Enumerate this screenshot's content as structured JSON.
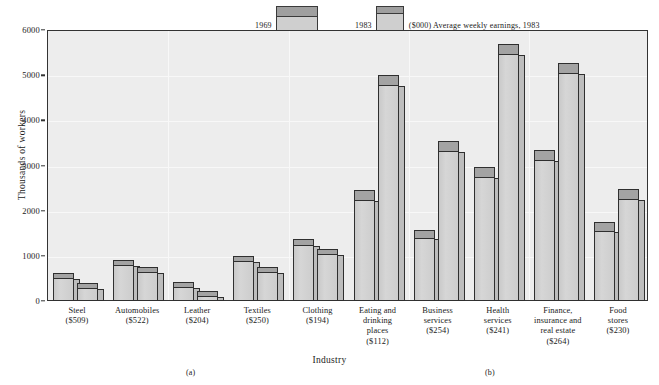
{
  "chart_data": {
    "type": "bar",
    "title": "",
    "xlabel": "Industry",
    "ylabel": "Thousands of workers",
    "ylim": [
      0,
      6000
    ],
    "yticks": [
      0,
      1000,
      2000,
      3000,
      4000,
      5000,
      6000
    ],
    "grid": true,
    "legend_position": "top",
    "legend_note": "($000) Average weekly earnings, 1983",
    "series": [
      {
        "name": "1969",
        "values": [
          620,
          900,
          410,
          1000,
          1380,
          2450,
          1570,
          2960,
          3340,
          1740
        ]
      },
      {
        "name": "1983",
        "values": [
          400,
          760,
          230,
          750,
          1150,
          5000,
          3540,
          5690,
          5270,
          2480
        ]
      }
    ],
    "categories": [
      "Steel",
      "Automobiles",
      "Leather",
      "Textiles",
      "Clothing",
      "Eating and drinking places",
      "Business services",
      "Health services",
      "Finance, insurance and real estate",
      "Food stores"
    ],
    "category_lines": [
      [
        "Steel",
        "($509)"
      ],
      [
        "Automobiles",
        "($522)"
      ],
      [
        "Leather",
        "($204)"
      ],
      [
        "Textiles",
        "($250)"
      ],
      [
        "Clothing",
        "($194)"
      ],
      [
        "Eating and",
        "drinking",
        "places",
        "($112)"
      ],
      [
        "Business",
        "services",
        "($254)"
      ],
      [
        "Health",
        "services",
        "($241)"
      ],
      [
        "Finance,",
        "insurance and",
        "real estate",
        "($264)"
      ],
      [
        "Food",
        "stores",
        "($230)"
      ]
    ],
    "earnings": [
      "($509)",
      "($522)",
      "($204)",
      "($250)",
      "($194)",
      "($112)",
      "($254)",
      "($241)",
      "($264)",
      "($230)"
    ]
  },
  "subfigures": {
    "left": "(a)",
    "right": "(b)"
  },
  "colors": {
    "bar_front": "#d0d0d0",
    "bar_top": "#a3a3a3",
    "plot_background": "#ededed",
    "axis": "#333333",
    "text": "#1a1a1a"
  }
}
